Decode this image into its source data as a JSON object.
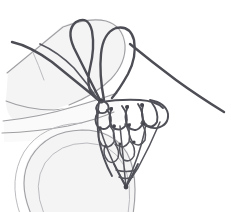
{
  "illustration": {
    "title": "Netting in progress held on a hand",
    "subject": "hand-netting-diagram",
    "background_color": "#ffffff",
    "canvas": {
      "width": 231,
      "height": 212
    },
    "palette": {
      "thread_dark": "#4d4d55",
      "thread_mid": "#55555e",
      "mesh_stroke": "#4f4f58",
      "knot": "#45454d",
      "hand_outline": "#a0a0a4",
      "hand_outline_faint": "#bcbcc0",
      "hand_fill": "#f4f4f5",
      "hand_fill_soft": "#fafafa",
      "background": "#ffffff"
    },
    "elements": {
      "hand": {
        "name": "hand-holding-net",
        "parts": [
          {
            "name": "index-finger",
            "description": "pale elongated finger crossing upper-left to center, outlined in light gray"
          },
          {
            "name": "lower-finger",
            "description": "second pale finger below, partially behind the net"
          },
          {
            "name": "thumb",
            "description": "large rounded pale thumb form at lower left"
          },
          {
            "name": "palm-edge",
            "description": "faint curved contour across the lower-left area"
          }
        ]
      },
      "threads": {
        "name": "working-thread",
        "loops": [
          {
            "name": "left-loop",
            "description": "tall narrow thread loop rising over the finger at upper left"
          },
          {
            "name": "right-loop",
            "description": "tall rounded thread loop rising over the finger at upper center"
          }
        ],
        "strands": [
          {
            "name": "long-tail-right",
            "description": "thread running from the net's upper right down to the right edge"
          },
          {
            "name": "long-tail-left",
            "description": "thread running from the net down across to the left edge"
          },
          {
            "name": "tensioned-strand",
            "description": "thread passing from loop down into the mesh knot cluster"
          }
        ]
      },
      "mesh": {
        "name": "netting-mesh",
        "description": "triangular hand-knotted net with rows of open loops narrowing to a point",
        "row_count": 4,
        "rows": [
          {
            "index": 1,
            "loop_count": 1,
            "note": "topmost small loop at the anchor knot"
          },
          {
            "index": 2,
            "loop_count": 4,
            "note": "widest row of rounded loops"
          },
          {
            "index": 3,
            "loop_count": 3,
            "note": "middle row of loops"
          },
          {
            "index": 4,
            "loop_count": 2,
            "note": "narrow row approaching the tip"
          }
        ],
        "tip": {
          "name": "net-point",
          "description": "dense cluster of knots where the mesh converges"
        },
        "anchor_knot": {
          "name": "anchor-knot",
          "description": "knot where the working threads enter the mesh"
        }
      }
    }
  }
}
